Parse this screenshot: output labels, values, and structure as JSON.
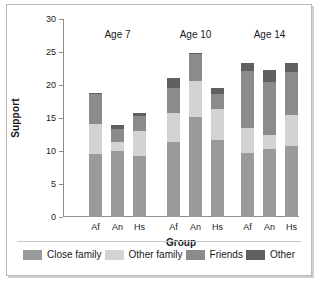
{
  "chart_data": {
    "type": "bar",
    "subtype": "stacked-bar-grouped",
    "title": "",
    "xlabel": "Group",
    "ylabel": "Support",
    "ylim": [
      0,
      30
    ],
    "yticks": [
      0,
      5,
      10,
      15,
      20,
      25,
      30
    ],
    "ytick_labels": [
      "0",
      "5",
      "10",
      "15",
      "20",
      "25",
      "30"
    ],
    "grid": false,
    "legend_position": "bottom",
    "group_headers": [
      "Age 7",
      "Age 10",
      "Age 14"
    ],
    "categories": [
      "Af",
      "An",
      "Hs",
      "Af",
      "An",
      "Hs",
      "Af",
      "An",
      "Hs"
    ],
    "series": [
      {
        "name": "Close family",
        "color": "#9a9a9a",
        "values": [
          9.5,
          10.0,
          9.3,
          11.3,
          15.2,
          11.6,
          9.7,
          10.3,
          10.8
        ]
      },
      {
        "name": "Other family",
        "color": "#d3d3d3",
        "values": [
          4.6,
          1.3,
          3.7,
          4.4,
          5.4,
          4.8,
          3.8,
          2.2,
          4.7
        ]
      },
      {
        "name": "Friends",
        "color": "#8b8b8b",
        "values": [
          4.5,
          2.1,
          2.3,
          3.9,
          4.1,
          2.3,
          8.7,
          8.0,
          6.5
        ]
      },
      {
        "name": "Other",
        "color": "#606060",
        "values": [
          0.2,
          0.6,
          0.4,
          1.4,
          0.2,
          0.8,
          1.2,
          1.8,
          1.4
        ]
      }
    ],
    "totals": [
      18.8,
      14.0,
      15.7,
      21.0,
      24.9,
      19.5,
      23.4,
      22.3,
      23.4
    ]
  },
  "legend": {
    "items": [
      {
        "label": "Close family"
      },
      {
        "label": "Other family"
      },
      {
        "label": "Friends"
      },
      {
        "label": "Other"
      }
    ]
  }
}
